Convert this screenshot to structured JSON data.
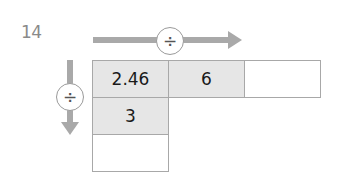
{
  "question": {
    "number": "14"
  },
  "operators": {
    "horizontal": {
      "symbol": "÷",
      "direction": "right"
    },
    "vertical": {
      "symbol": "÷",
      "direction": "down"
    }
  },
  "grid": {
    "rows": [
      [
        "2.46",
        "6",
        ""
      ],
      [
        "3",
        null,
        null
      ],
      [
        "",
        null,
        null
      ]
    ]
  },
  "colors": {
    "arrow": "#a9a9a9",
    "cell_shaded": "#e6e6e6",
    "border": "#a8a8a8",
    "number_gray": "#8a8a8a"
  }
}
